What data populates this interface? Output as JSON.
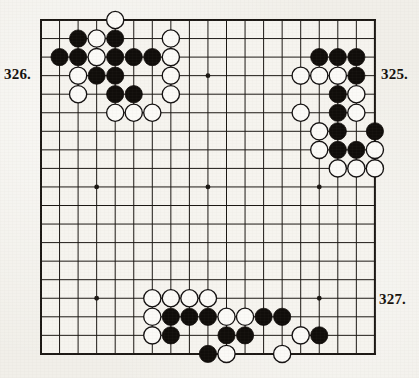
{
  "document": {
    "kind": "go-problem-diagram-page",
    "background_color": "#f1efe9"
  },
  "board": {
    "size": 19,
    "left": 41,
    "top": 20,
    "spacing": 18.55,
    "line_color": "#1b1713",
    "border_width": 2.0,
    "line_width": 1.0,
    "star_points": [
      [
        3,
        3
      ],
      [
        9,
        3
      ],
      [
        15,
        3
      ],
      [
        3,
        9
      ],
      [
        9,
        9
      ],
      [
        15,
        9
      ],
      [
        3,
        15
      ],
      [
        9,
        15
      ],
      [
        15,
        15
      ]
    ],
    "star_radius": 2.4,
    "stone_radius": 8.6,
    "black_color": "#100d0a",
    "white_color": "#fbfaf7",
    "white_outline": "#131010"
  },
  "labels": [
    {
      "id": "label-326",
      "text": "326."
    },
    {
      "id": "label-325",
      "text": "325."
    },
    {
      "id": "label-327",
      "text": "327."
    }
  ],
  "stones": {
    "black": [
      [
        4,
        1
      ],
      [
        2,
        1
      ],
      [
        1,
        2
      ],
      [
        4,
        2
      ],
      [
        2,
        2
      ],
      [
        5,
        2
      ],
      [
        6,
        2
      ],
      [
        3,
        3
      ],
      [
        4,
        3
      ],
      [
        4,
        4
      ],
      [
        5,
        4
      ],
      [
        15,
        2
      ],
      [
        16,
        2
      ],
      [
        17,
        2
      ],
      [
        17,
        3
      ],
      [
        16,
        4
      ],
      [
        16,
        5
      ],
      [
        16,
        6
      ],
      [
        18,
        6
      ],
      [
        16,
        7
      ],
      [
        17,
        7
      ],
      [
        7,
        16
      ],
      [
        8,
        16
      ],
      [
        9,
        16
      ],
      [
        12,
        16
      ],
      [
        13,
        16
      ],
      [
        7,
        17
      ],
      [
        10,
        17
      ],
      [
        11,
        17
      ],
      [
        15,
        17
      ],
      [
        9,
        18
      ]
    ],
    "white": [
      [
        4,
        0
      ],
      [
        3,
        1
      ],
      [
        7,
        1
      ],
      [
        3,
        2
      ],
      [
        7,
        2
      ],
      [
        2,
        3
      ],
      [
        7,
        3
      ],
      [
        2,
        4
      ],
      [
        7,
        4
      ],
      [
        4,
        5
      ],
      [
        5,
        5
      ],
      [
        6,
        5
      ],
      [
        14,
        3
      ],
      [
        15,
        3
      ],
      [
        16,
        3
      ],
      [
        17,
        4
      ],
      [
        14,
        5
      ],
      [
        17,
        5
      ],
      [
        15,
        6
      ],
      [
        15,
        7
      ],
      [
        18,
        7
      ],
      [
        16,
        8
      ],
      [
        17,
        8
      ],
      [
        18,
        8
      ],
      [
        6,
        15
      ],
      [
        7,
        15
      ],
      [
        8,
        15
      ],
      [
        9,
        15
      ],
      [
        6,
        16
      ],
      [
        10,
        16
      ],
      [
        11,
        16
      ],
      [
        6,
        17
      ],
      [
        14,
        17
      ],
      [
        10,
        18
      ],
      [
        13,
        18
      ]
    ]
  },
  "chart_data": {
    "type": "table",
    "xlabel": "board column (0-18, left to right)",
    "ylabel": "board row (0-18, top to bottom)",
    "categories": [
      "black stones",
      "white stones"
    ],
    "values": [
      31,
      35
    ]
  }
}
